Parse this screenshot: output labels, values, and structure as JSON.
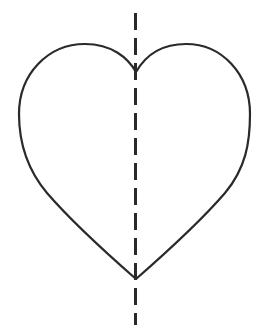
{
  "figure": {
    "title": "Heart shape with vertical line of symmetry",
    "canvas": {
      "width": 266,
      "height": 331,
      "background_color": "#ffffff"
    },
    "shape": {
      "name": "heart",
      "label": "heart outline",
      "stroke_color": "#2a2a2a",
      "stroke_width": 2.2,
      "fill": "none",
      "geometry": {
        "top_notch": [
          136,
          72
        ],
        "bottom_point": [
          136,
          279
        ],
        "left_extreme": [
          19,
          128
        ],
        "right_extreme": [
          250,
          122
        ],
        "left_lobe_peak": [
          85,
          50
        ],
        "right_lobe_peak": [
          186,
          50
        ]
      },
      "path": "M 136 72 C 128 58 112 44 85 44 C 48 44 19 74 19 114 C 19 142 26 168 47 193 C 72 222 112 258 136 279 C 160 258 200 222 225 193 C 246 168 250 142 250 114 C 250 74 222 44 186 44 C 159 44 144 58 136 72 Z"
    },
    "symmetry_line": {
      "name": "line of symmetry",
      "label": "vertical dashed axis",
      "orientation": "vertical",
      "stroke_color": "#2a2a2a",
      "stroke_width": 3,
      "dash_length": 17,
      "gap_length": 8,
      "x": 135.5,
      "y_start": 13,
      "y_end": 325
    }
  }
}
